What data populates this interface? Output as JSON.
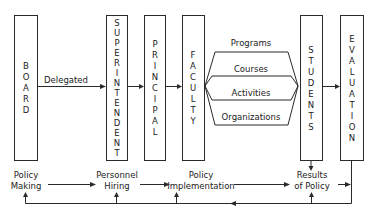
{
  "diagram": {
    "boxes": [
      {
        "id": "board",
        "label": "BOARD"
      },
      {
        "id": "superintendent",
        "label": "SUPERINTENDENT"
      },
      {
        "id": "principal",
        "label": "PRINCIPAL"
      },
      {
        "id": "faculty",
        "label": "FACULTY"
      },
      {
        "id": "students",
        "label": "STUDENTS"
      },
      {
        "id": "evaluation",
        "label": "EVALUATION"
      }
    ],
    "edge_labels": {
      "board_to_superintendent": "Delegated"
    },
    "channels": [
      {
        "label": "Programs"
      },
      {
        "label": "Courses"
      },
      {
        "label": "Activities"
      },
      {
        "label": "Organizations"
      }
    ],
    "process_steps": [
      {
        "line1": "Policy",
        "line2": "Making"
      },
      {
        "line1": "Personnel",
        "line2": "Hiring"
      },
      {
        "line1": "Policy",
        "line2": "Implementation"
      },
      {
        "line1": "Results",
        "line2": "of Policy"
      }
    ]
  }
}
